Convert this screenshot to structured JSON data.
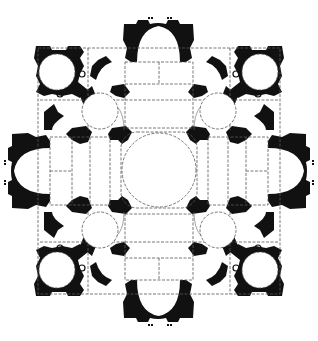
{
  "figure": {
    "colors": {
      "wall": "#111111",
      "background": "#ffffff",
      "dashed_lines": "#555555"
    }
  },
  "plan": {
    "central_dome": {
      "cx": 159,
      "cy": 170,
      "r": 37
    },
    "arms": [
      {
        "name": "north",
        "apse": {
          "cx": 158.5,
          "cy": 55,
          "rx": 22,
          "ry": 32
        }
      },
      {
        "name": "south",
        "apse": {
          "cx": 158.5,
          "cy": 287,
          "rx": 22,
          "ry": 32
        }
      },
      {
        "name": "west",
        "apse": {
          "cx": 48,
          "cy": 171,
          "rx": 32,
          "ry": 22
        }
      },
      {
        "name": "east",
        "apse": {
          "cx": 270,
          "cy": 171,
          "rx": 32,
          "ry": 22
        }
      }
    ],
    "corner_chapels": [
      {
        "name": "north-west",
        "outer": {
          "cx": 57,
          "cy": 72,
          "r": 18
        },
        "inner": {
          "cx": 100,
          "cy": 111,
          "r": 18
        }
      },
      {
        "name": "north-east",
        "outer": {
          "cx": 260,
          "cy": 72,
          "r": 18
        },
        "inner": {
          "cx": 218,
          "cy": 111,
          "r": 18
        }
      },
      {
        "name": "south-west",
        "outer": {
          "cx": 57,
          "cy": 270,
          "r": 18
        },
        "inner": {
          "cx": 100,
          "cy": 230,
          "r": 18
        }
      },
      {
        "name": "south-east",
        "outer": {
          "cx": 260,
          "cy": 270,
          "r": 18
        },
        "inner": {
          "cx": 218,
          "cy": 230,
          "r": 18
        }
      }
    ]
  }
}
